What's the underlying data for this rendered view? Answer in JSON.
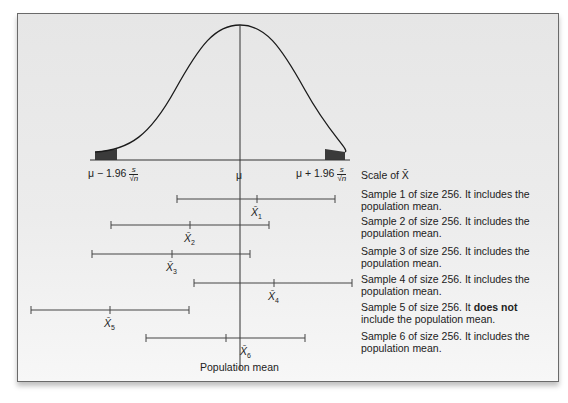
{
  "axis": {
    "left_label": "μ − 1.96 s/√n",
    "left_prefix": "μ − 1.96",
    "center_label": "μ",
    "right_prefix": "μ + 1.96",
    "frac_num": "s",
    "frac_den": "√n",
    "scale_label": "Scale of X̄"
  },
  "population_mean_label": "Population mean",
  "samples": [
    {
      "label": "X̄1",
      "sub": "1",
      "desc_pre": "Sample 1 of size 256. It",
      "desc_bold": "",
      "desc_post": " includes the population mean.",
      "includes": true
    },
    {
      "label": "X̄2",
      "sub": "2",
      "desc_pre": "Sample 2 of size 256. It",
      "desc_bold": "",
      "desc_post": " includes the population mean.",
      "includes": true
    },
    {
      "label": "X̄3",
      "sub": "3",
      "desc_pre": "Sample 3 of size 256. It",
      "desc_bold": "",
      "desc_post": " includes the population mean.",
      "includes": true
    },
    {
      "label": "X̄4",
      "sub": "4",
      "desc_pre": "Sample 4 of size 256. It",
      "desc_bold": "",
      "desc_post": " includes the population mean.",
      "includes": true
    },
    {
      "label": "X̄5",
      "sub": "5",
      "desc_pre": "Sample 5 of size 256. It ",
      "desc_bold": "does not",
      "desc_post": " include the population mean.",
      "includes": false
    },
    {
      "label": "X̄6",
      "sub": "6",
      "desc_pre": "Sample 6 of size 256. It",
      "desc_bold": "",
      "desc_post": " includes the population mean.",
      "includes": true
    }
  ],
  "colors": {
    "curve": "#1a1a1a",
    "tail_fill": "#3a3a3a",
    "line": "#333333",
    "frame_bg": "#e9e9e9"
  }
}
